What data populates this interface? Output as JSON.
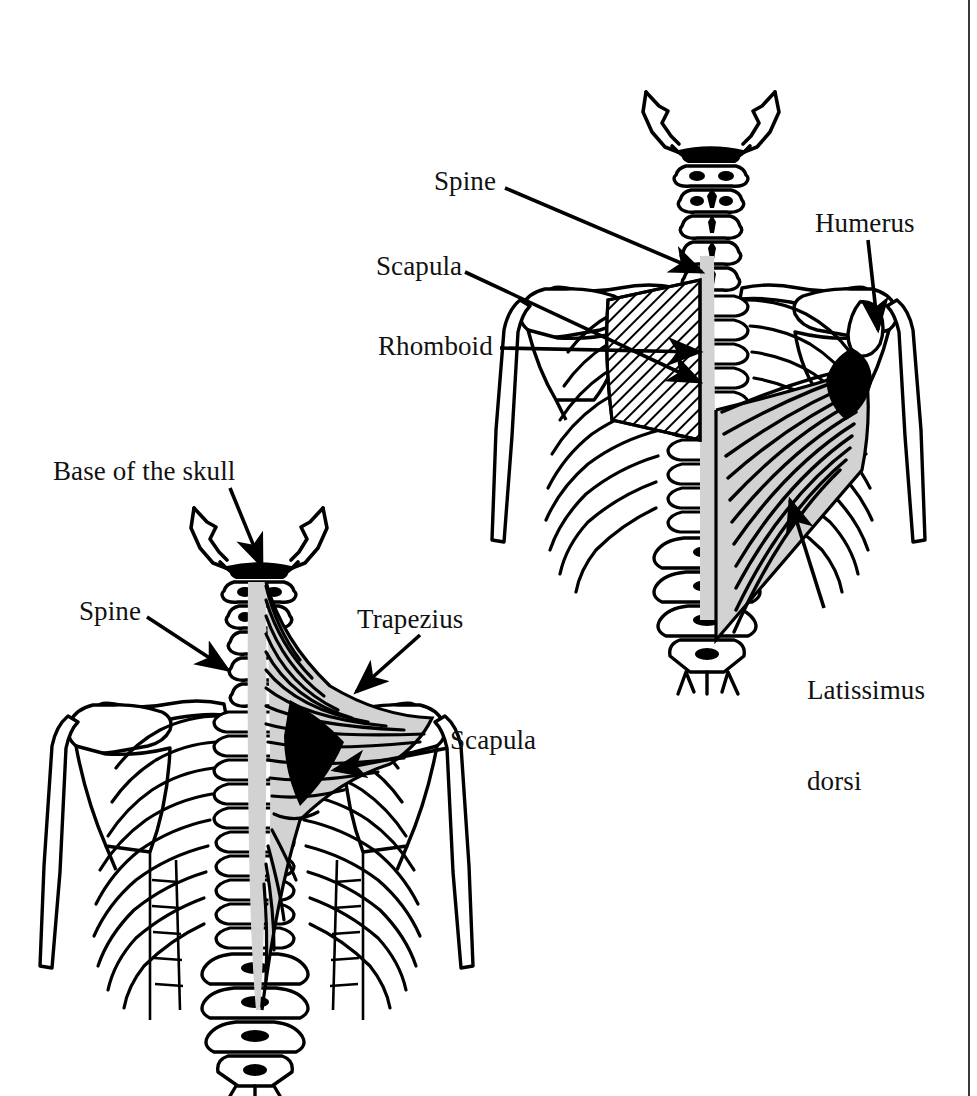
{
  "figure": {
    "kind": "anatomical-line-drawing",
    "title_text": "",
    "background_color": "#ffffff",
    "ink_color": "#000000",
    "muscle_fill_gray": "#d2d2d2",
    "border": {
      "side": "right",
      "color": "#3a3a3a",
      "width_px": 2
    },
    "panels": [
      {
        "id": "upper-right-panel",
        "view": "posterior view of thorax, shoulder girdle and spine",
        "muscles_shown": [
          "Rhomboid",
          "Latissimus dorsi"
        ],
        "bones_shown": [
          "Base of skull",
          "Cervical vertebrae",
          "Thoracic vertebrae",
          "Lumbar vertebrae",
          "Ribs",
          "Scapula",
          "Clavicle",
          "Humerus"
        ]
      },
      {
        "id": "lower-left-panel",
        "view": "posterior view of thorax, shoulder girdle and spine",
        "muscles_shown": [
          "Trapezius"
        ],
        "bones_shown": [
          "Base of skull",
          "Cervical vertebrae",
          "Thoracic vertebrae",
          "Lumbar vertebrae",
          "Ribs",
          "Scapula",
          "Clavicle",
          "Humerus"
        ]
      }
    ]
  },
  "labels": {
    "upper": {
      "spine": "Spine",
      "scapula": "Scapula",
      "rhomboid": "Rhomboid",
      "humerus": "Humerus",
      "latissimus_line1": "Latissimus",
      "latissimus_line2": "dorsi"
    },
    "lower": {
      "base_of_skull": "Base of the skull",
      "spine": "Spine",
      "trapezius": "Trapezius",
      "scapula": "Scapula"
    }
  }
}
